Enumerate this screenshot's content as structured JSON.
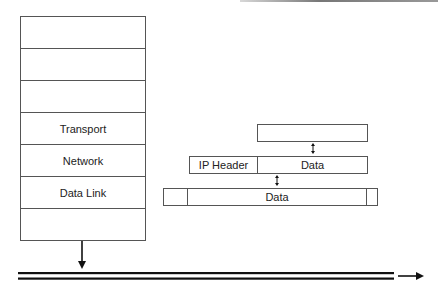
{
  "diagram": {
    "type": "protocol-encapsulation",
    "stack": {
      "layers": [
        {
          "label": ""
        },
        {
          "label": ""
        },
        {
          "label": ""
        },
        {
          "label": "Transport"
        },
        {
          "label": "Network"
        },
        {
          "label": "Data Link"
        },
        {
          "label": ""
        }
      ]
    },
    "frames": {
      "transport_segment": {
        "label": ""
      },
      "ip_packet": {
        "header_label": "IP Header",
        "data_label": "Data"
      },
      "link_frame": {
        "header_label": "",
        "data_label": "Data",
        "trailer_label": ""
      }
    },
    "colors": {
      "stroke": "#555555",
      "text": "#222222",
      "arrow": "#111111",
      "background": "#ffffff"
    }
  }
}
